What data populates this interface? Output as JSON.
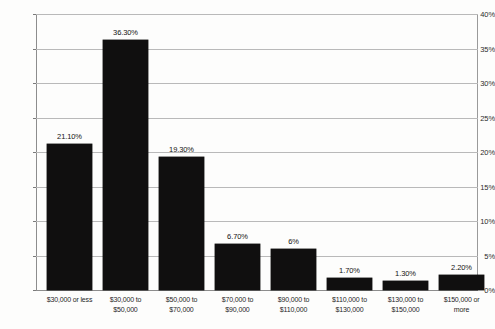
{
  "chart_data": {
    "type": "bar",
    "title": "",
    "subtitle": "",
    "xlabel": "",
    "ylabel": "",
    "ylim": [
      0,
      40
    ],
    "ytick_step": 5,
    "grid": true,
    "legend": false,
    "bar_color": "#100f0f",
    "gridline_color": "#b9b9b9",
    "categories": [
      "$30,000 or less",
      "$30,000 to $50,000",
      "$50,000 to $70,000",
      "$70,000 to $90,000",
      "$90,000 to $110,000",
      "$110,000 to $130,000",
      "$130,000 to $150,000",
      "$150,000 or more"
    ],
    "category_lines": [
      [
        "$30,000 or less"
      ],
      [
        "$30,000 to",
        "$50,000"
      ],
      [
        "$50,000 to",
        "$70,000"
      ],
      [
        "$70,000 to",
        "$90,000"
      ],
      [
        "$90,000 to",
        "$110,000"
      ],
      [
        "$110,000 to",
        "$130,000"
      ],
      [
        "$130,000 to",
        "$150,000"
      ],
      [
        "$150,000 or",
        "more"
      ]
    ],
    "values": [
      21.1,
      36.3,
      19.3,
      6.7,
      6.0,
      1.7,
      1.3,
      2.2
    ],
    "value_labels": [
      "21.10%",
      "36.30%",
      "19.30%",
      "6.70%",
      "6%",
      "1.70%",
      "1.30%",
      "2.20%"
    ],
    "ytick_labels": [
      "40%",
      "35%",
      "30%",
      "25%",
      "20%",
      "15%",
      "10%",
      "5%",
      "0%"
    ],
    "ytick_values": [
      40,
      35,
      30,
      25,
      20,
      15,
      10,
      5,
      0
    ]
  }
}
